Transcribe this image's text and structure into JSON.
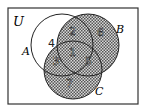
{
  "diagram": {
    "universe_label": "U",
    "sets": [
      {
        "label": "A",
        "cx": 62,
        "cy": 45,
        "r": 31
      },
      {
        "label": "B",
        "cx": 88,
        "cy": 45,
        "r": 31
      },
      {
        "label": "C",
        "cx": 73,
        "cy": 70,
        "r": 29
      }
    ],
    "shaded": "B ∪ C",
    "shade_color": "#777777",
    "regions": [
      {
        "label": "1",
        "x": 73,
        "y": 54
      },
      {
        "label": "2",
        "x": 73,
        "y": 34
      },
      {
        "label": "3",
        "x": 57,
        "y": 65
      },
      {
        "label": "4",
        "x": 48,
        "y": 43
      },
      {
        "label": "5",
        "x": 89,
        "y": 65
      },
      {
        "label": "6",
        "x": 101,
        "y": 34
      },
      {
        "label": "7",
        "x": 70,
        "y": 85
      }
    ]
  }
}
